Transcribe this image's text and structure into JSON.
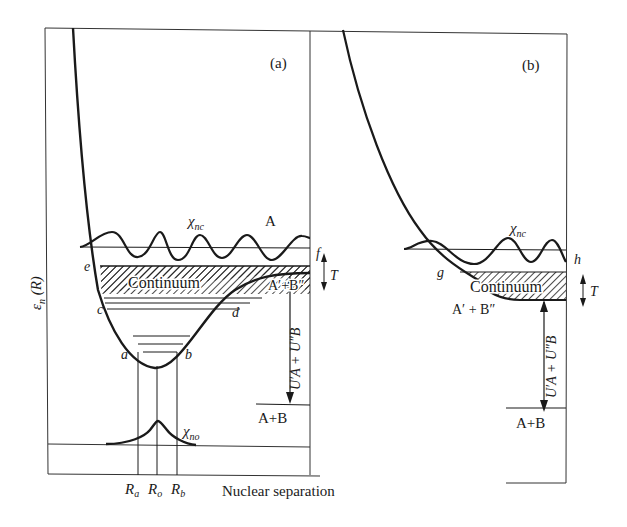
{
  "figure": {
    "y_axis_label": "ε",
    "y_axis_sub": "n",
    "y_axis_arg": " (R)",
    "x_axis_label": "Nuclear separation",
    "x_ticks": [
      {
        "main": "R",
        "sub": "a"
      },
      {
        "main": "R",
        "sub": "o"
      },
      {
        "main": "R",
        "sub": "b"
      }
    ]
  },
  "panel_a": {
    "tag": "(a)",
    "chi_continuum": "χ",
    "chi_continuum_sub": "nc",
    "state_upper": "A",
    "continuum_label": "Continuum",
    "excited_asymptote": "A′+B″",
    "ground_asymptote": "A+B",
    "chi_bound": "χ",
    "chi_bound_sub": "no",
    "point_labels": {
      "a": "a",
      "b": "b",
      "c": "c",
      "d": "d",
      "e": "e",
      "f": "f"
    },
    "kinetic_label": "T",
    "energy_gap_label": "U′A + U″B"
  },
  "panel_b": {
    "tag": "(b)",
    "chi_continuum": "χ",
    "chi_continuum_sub": "nc",
    "continuum_label": "Continuum",
    "excited_asymptote": "A′ + B″",
    "ground_asymptote": "A+B",
    "point_labels": {
      "g": "g",
      "h": "h"
    },
    "kinetic_label": "T",
    "energy_gap_label": "U′A + U″B"
  },
  "colors": {
    "ink": "#1a1a1a",
    "paper": "#ffffff"
  }
}
